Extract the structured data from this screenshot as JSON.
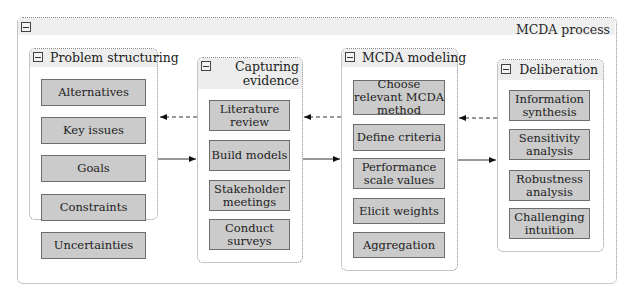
{
  "diagram": {
    "title": "MCDA process",
    "groups": [
      {
        "title": "Problem structuring",
        "items": [
          "Alternatives",
          "Key issues",
          "Goals",
          "Constraints",
          "Uncertainties"
        ]
      },
      {
        "title": "Capturing evidence",
        "title_lines": [
          "Capturing",
          "evidence"
        ],
        "items": [
          "Literature review",
          "Build models",
          "Stakeholder meetings",
          "Conduct surveys"
        ]
      },
      {
        "title": "MCDA modeling",
        "items": [
          "Choose relevant MCDA method",
          "Define criteria",
          "Performance scale values",
          "Elicit weights",
          "Aggregation"
        ]
      },
      {
        "title": "Deliberation",
        "items": [
          "Information synthesis",
          "Sensitivity analysis",
          "Robustness analysis",
          "Challenging intuition"
        ]
      }
    ],
    "connections": [
      {
        "from": "Problem structuring",
        "to": "Capturing evidence",
        "style": "solid"
      },
      {
        "from": "Capturing evidence",
        "to": "Problem structuring",
        "style": "dashed"
      },
      {
        "from": "Capturing evidence",
        "to": "MCDA modeling",
        "style": "solid"
      },
      {
        "from": "MCDA modeling",
        "to": "Capturing evidence",
        "style": "dashed"
      },
      {
        "from": "MCDA modeling",
        "to": "Deliberation",
        "style": "solid"
      },
      {
        "from": "Deliberation",
        "to": "MCDA modeling",
        "style": "dashed"
      }
    ],
    "colors": {
      "item_fill": "#cbcbcb",
      "item_border": "#6e6e6e",
      "header_fill": "#ededed",
      "frame_border": "#8a8a8a"
    }
  }
}
